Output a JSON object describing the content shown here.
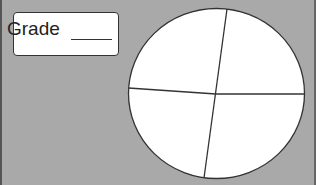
{
  "grade_box": {
    "label": "Grade",
    "value": ""
  },
  "circle": {
    "divisions": 4,
    "fill": "#ffffff",
    "stroke": "#333333"
  },
  "colors": {
    "background": "#a9a9a9"
  }
}
